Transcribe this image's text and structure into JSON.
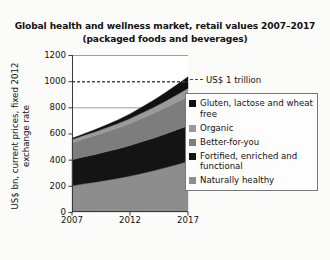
{
  "figure": {
    "title_line1": "Global health and wellness market, retail values 2007–2017",
    "title_line2": "(packaged foods and beverages)",
    "ylabel_line1": "US$ bn, current prices, fixed 2012",
    "ylabel_line2": "exchange rate"
  },
  "annotation": {
    "trillion_label": "US$ 1 trillion"
  },
  "legend": {
    "items": [
      {
        "label": "Gluten, lactose and wheat free",
        "color": "#111111"
      },
      {
        "label": "Organic",
        "color": "#9a9a9a"
      },
      {
        "label": "Better-for-you",
        "color": "#7d7d7d"
      },
      {
        "label": "Fortified, enriched and functional",
        "color": "#141414"
      },
      {
        "label": "Naturally healthy",
        "color": "#8d8d8d"
      }
    ]
  },
  "chart_data": {
    "type": "area",
    "title": "Global health and wellness market, retail values 2007–2017 (packaged foods and beverages)",
    "xlabel": "",
    "ylabel": "US$ bn, current prices, fixed 2012 exchange rate",
    "ylim": [
      0,
      1200
    ],
    "xlim": [
      2007,
      2017
    ],
    "yticks": [
      0,
      200,
      400,
      600,
      800,
      1000,
      1200
    ],
    "xticks": [
      2007,
      2012,
      2017
    ],
    "xtick_labels": [
      "2007",
      "2012",
      "2017"
    ],
    "ytick_labels": [
      "0",
      "200",
      "400",
      "600",
      "800",
      "1000",
      "1200"
    ],
    "grid": "horizontal-partial",
    "legend_position": "right",
    "stacked": true,
    "x": [
      2007,
      2008,
      2009,
      2010,
      2011,
      2012,
      2013,
      2014,
      2015,
      2016,
      2017
    ],
    "series": [
      {
        "name": "Naturally healthy",
        "color": "#8d8d8d",
        "values": [
          200,
          215,
          228,
          243,
          258,
          275,
          295,
          315,
          338,
          362,
          388
        ]
      },
      {
        "name": "Fortified, enriched and functional",
        "color": "#141414",
        "values": [
          200,
          206,
          212,
          219,
          226,
          233,
          241,
          249,
          257,
          265,
          272
        ]
      },
      {
        "name": "Better-for-you",
        "color": "#7d7d7d",
        "values": [
          130,
          137,
          144,
          152,
          160,
          169,
          179,
          189,
          200,
          212,
          224
        ]
      },
      {
        "name": "Organic",
        "color": "#9a9a9a",
        "values": [
          25,
          27,
          29,
          31,
          34,
          37,
          41,
          45,
          50,
          55,
          61
        ]
      },
      {
        "name": "Gluten, lactose and wheat free",
        "color": "#111111",
        "values": [
          8,
          12,
          17,
          22,
          28,
          36,
          45,
          55,
          65,
          76,
          88
        ]
      }
    ],
    "totals": [
      563,
      597,
      630,
      667,
      706,
      750,
      801,
      853,
      910,
      970,
      1033
    ],
    "reference_line": {
      "label": "US$ 1 trillion",
      "value": 1000,
      "style": "dashed",
      "color": "#4a4a4a"
    }
  }
}
